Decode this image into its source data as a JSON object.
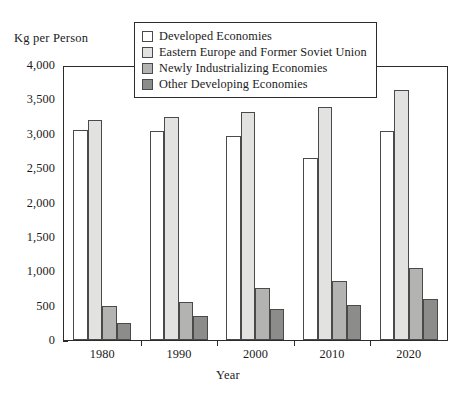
{
  "chart_data": {
    "type": "bar",
    "title": "",
    "xlabel": "Year",
    "ylabel": "Kg per Person",
    "categories": [
      "1980",
      "1990",
      "2000",
      "2010",
      "2020"
    ],
    "ylim": [
      0,
      4000
    ],
    "ytick_labels": [
      "0",
      "500",
      "1,000",
      "1,500",
      "2,000",
      "2,500",
      "3,000",
      "3,500",
      "4,000"
    ],
    "ytick_values": [
      0,
      500,
      1000,
      1500,
      2000,
      2500,
      3000,
      3500,
      4000
    ],
    "grid": false,
    "legend_position": "top-center",
    "series": [
      {
        "name": "Developed Economies",
        "color": "#ffffff",
        "values": [
          3080,
          3060,
          2990,
          2670,
          3060
        ]
      },
      {
        "name": "Eastern Europe and Former Soviet Union",
        "color": "#e2e2e0",
        "values": [
          3220,
          3270,
          3340,
          3420,
          3670
        ]
      },
      {
        "name": "Newly Industrializing Economies",
        "color": "#b3b3b1",
        "values": [
          500,
          550,
          760,
          870,
          1060
        ]
      },
      {
        "name": "Other Developing Economies",
        "color": "#8c8c8a",
        "values": [
          250,
          350,
          460,
          520,
          600
        ]
      }
    ]
  },
  "axis": {
    "y_title": "Kg per Person",
    "x_title": "Year"
  }
}
